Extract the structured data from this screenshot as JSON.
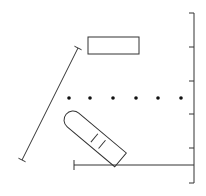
{
  "diagram": {
    "colors": {
      "stroke": "#333333",
      "dot": "#111111",
      "background": "#ffffff"
    },
    "right_scale": {
      "x": 194,
      "y_top": 13,
      "y_bottom": 183,
      "ticks_y": [
        13,
        47,
        81,
        114,
        148,
        183
      ],
      "tick_length": 5
    },
    "bottom_bar": {
      "y": 165,
      "x_start": 74,
      "x_end": 194
    },
    "diagonal_bar": {
      "x1": 78,
      "y1": 48,
      "x2": 22,
      "y2": 160
    },
    "rectangle": {
      "x": 88,
      "y": 37,
      "width": 51,
      "height": 17
    },
    "dots": {
      "y": 98,
      "x": [
        69,
        90,
        113,
        136,
        158,
        181
      ],
      "r": 1.8
    },
    "capsule": {
      "cx": 73,
      "cy": 120,
      "length": 62,
      "width": 18,
      "angle": 40,
      "marks": 2
    }
  }
}
